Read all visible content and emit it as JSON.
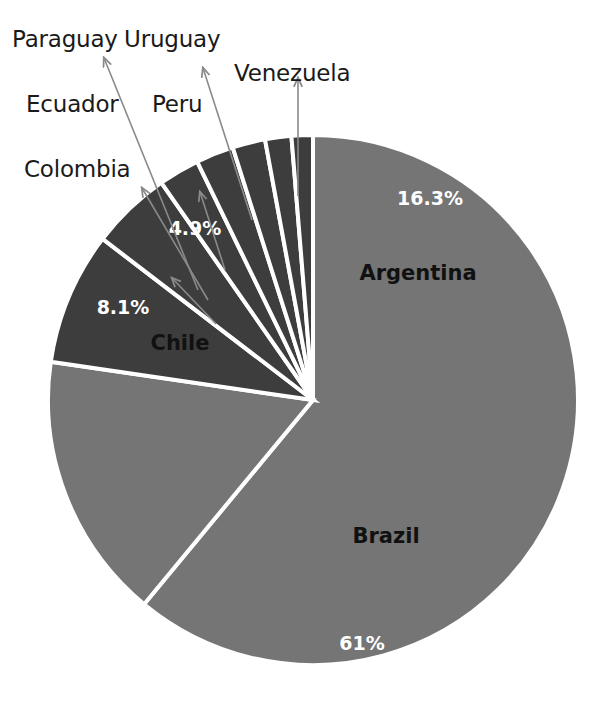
{
  "chart_data": {
    "type": "pie",
    "title": "",
    "subtitle": "",
    "xlabel": "",
    "ylabel": "",
    "legend_position": "callout-labels",
    "grid": false,
    "start_angle_deg": 0,
    "direction": "clockwise",
    "categories": [
      "Brazil",
      "Argentina",
      "Chile",
      "Colombia",
      "Ecuador",
      "Peru",
      "Paraguay",
      "Uruguay",
      "Venezuela"
    ],
    "values": [
      61,
      16.3,
      8.1,
      4.9,
      2.5,
      2.3,
      2.0,
      1.6,
      1.3
    ],
    "labels_shown": [
      "61%",
      "16.3%",
      "8.1%",
      "4.9%"
    ],
    "slices": [
      {
        "name": "Brazil",
        "value": 61,
        "pct_label": "61%",
        "label_placement": "inside",
        "name_color": "#111111",
        "pct_color": "#ffffff",
        "fill": "#757575"
      },
      {
        "name": "Argentina",
        "value": 16.3,
        "pct_label": "16.3%",
        "label_placement": "inside",
        "name_color": "#111111",
        "pct_color": "#ffffff",
        "fill": "#757575"
      },
      {
        "name": "Chile",
        "value": 8.1,
        "pct_label": "8.1%",
        "label_placement": "inside",
        "name_color": "#111111",
        "pct_color": "#ffffff",
        "fill": "#3d3d3d"
      },
      {
        "name": "Colombia",
        "value": 4.9,
        "pct_label": "4.9%",
        "label_placement": "callout",
        "name_color": "#1a1a1a",
        "pct_color": "#ffffff",
        "fill": "#3d3d3d"
      },
      {
        "name": "Ecuador",
        "value": 2.5,
        "pct_label": "",
        "label_placement": "callout",
        "name_color": "#1a1a1a",
        "pct_color": "",
        "fill": "#3d3d3d"
      },
      {
        "name": "Peru",
        "value": 2.3,
        "pct_label": "",
        "label_placement": "callout",
        "name_color": "#1a1a1a",
        "pct_color": "",
        "fill": "#3d3d3d"
      },
      {
        "name": "Paraguay",
        "value": 2.0,
        "pct_label": "",
        "label_placement": "callout",
        "name_color": "#1a1a1a",
        "pct_color": "",
        "fill": "#3d3d3d"
      },
      {
        "name": "Uruguay",
        "value": 1.6,
        "pct_label": "",
        "label_placement": "callout",
        "name_color": "#1a1a1a",
        "pct_color": "",
        "fill": "#3d3d3d"
      },
      {
        "name": "Venezuela",
        "value": 1.3,
        "pct_label": "",
        "label_placement": "callout",
        "name_color": "#1a1a1a",
        "pct_color": "",
        "fill": "#3d3d3d"
      }
    ],
    "colors": {
      "light_gray_slice": "#757575",
      "dark_gray_slice": "#3d3d3d",
      "slice_border": "#ffffff",
      "background": "#ffffff",
      "leader_line": "#8a8a8a",
      "label_text": "#1a1a1a"
    },
    "geometry": {
      "center_x": 313,
      "center_y": 400,
      "radius": 265
    }
  },
  "callouts": {
    "paraguay": "Paraguay",
    "uruguay": "Uruguay",
    "venezuela": "Venezuela",
    "ecuador": "Ecuador",
    "peru": "Peru",
    "colombia": "Colombia"
  },
  "inside_labels": {
    "argentina_pct": "16.3%",
    "argentina_name": "Argentina",
    "brazil_name": "Brazil",
    "brazil_pct": "61%",
    "chile_pct": "8.1%",
    "chile_name": "Chile",
    "colombia_pct": "4.9%"
  }
}
